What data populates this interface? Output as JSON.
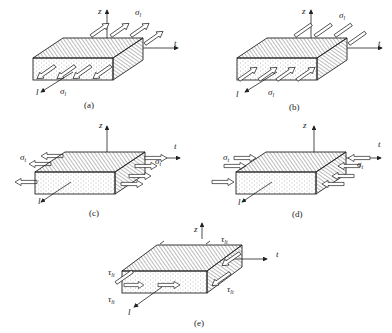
{
  "figure": {
    "panels": [
      {
        "id": "a",
        "caption": "(a)",
        "axes": {
          "z": "z",
          "t": "t",
          "l": "l"
        },
        "stress_symbol": "σ",
        "stress_subscript": "l",
        "load": "longitudinal tension",
        "arrow_dir": "outward"
      },
      {
        "id": "b",
        "caption": "(b)",
        "axes": {
          "z": "z",
          "t": "t",
          "l": "l"
        },
        "stress_symbol": "σ",
        "stress_subscript": "l",
        "load": "longitudinal compression",
        "arrow_dir": "inward"
      },
      {
        "id": "c",
        "caption": "(c)",
        "axes": {
          "z": "z",
          "t": "t",
          "l": "l"
        },
        "stress_symbol": "σ",
        "stress_subscript": "t",
        "load": "transverse tension",
        "arrow_dir": "outward"
      },
      {
        "id": "d",
        "caption": "(d)",
        "axes": {
          "z": "z",
          "t": "t",
          "l": "l"
        },
        "stress_symbol": "σ",
        "stress_subscript": "t",
        "load": "transverse compression",
        "arrow_dir": "inward"
      },
      {
        "id": "e",
        "caption": "(e)",
        "axes": {
          "z": "z",
          "t": "t",
          "l": "l"
        },
        "stress_symbol": "τ",
        "stress_subscript": "lt",
        "load": "in-plane shear",
        "arrow_dir": "shear"
      }
    ]
  },
  "colors": {
    "line": "#222222",
    "background": "#ffffff",
    "hatch": "#555555",
    "dots": "#777777"
  }
}
